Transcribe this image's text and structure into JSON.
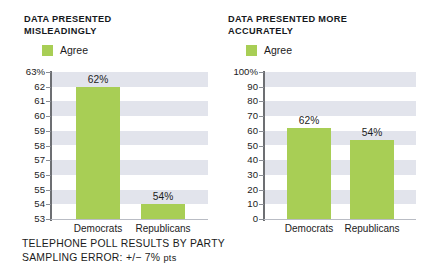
{
  "figure": {
    "background_color": "#ffffff",
    "accent_color": "#a8ce55",
    "band_color": "#e2e4ec",
    "axis_color": "#6d6f73",
    "caption_line_1": "TELEPHONE POLL RESULTS BY PARTY",
    "caption_line_2_prefix": "SAMPLING ERROR: ",
    "caption_line_2_value": "+/− 7% ",
    "caption_line_2_suffix": "pts"
  },
  "panels": [
    {
      "id": "left",
      "title": "DATA PRESENTED\nMISLEADINGLY",
      "legend_label": "Agree"
    },
    {
      "id": "right",
      "title": "DATA PRESENTED MORE\nACCURATELY",
      "legend_label": "Agree"
    }
  ],
  "chart_data": [
    {
      "type": "bar",
      "title": "DATA PRESENTED MISLEADINGLY",
      "xlabel": "",
      "ylabel": "",
      "categories": [
        "Democrats",
        "Republicans"
      ],
      "series": [
        {
          "name": "Agree",
          "values": [
            62,
            54
          ],
          "color": "#a8ce55"
        }
      ],
      "value_labels": [
        "62%",
        "54%"
      ],
      "ylim": [
        53,
        63
      ],
      "yticks": [
        53,
        54,
        55,
        56,
        57,
        58,
        59,
        60,
        61,
        62,
        63
      ],
      "ytick_labels": [
        "53",
        "54",
        "55",
        "56",
        "57",
        "58",
        "59",
        "60",
        "61",
        "62",
        "63%"
      ],
      "grid": "horizontal-alternating-bands",
      "legend": [
        "Agree"
      ],
      "legend_position": "top-left",
      "note": "Truncated y-axis starting at 53% exaggerates the difference"
    },
    {
      "type": "bar",
      "title": "DATA PRESENTED MORE ACCURATELY",
      "xlabel": "",
      "ylabel": "",
      "categories": [
        "Democrats",
        "Republicans"
      ],
      "series": [
        {
          "name": "Agree",
          "values": [
            62,
            54
          ],
          "color": "#a8ce55"
        }
      ],
      "value_labels": [
        "62%",
        "54%"
      ],
      "ylim": [
        0,
        100
      ],
      "yticks": [
        0,
        10,
        20,
        30,
        40,
        50,
        60,
        70,
        80,
        90,
        100
      ],
      "ytick_labels": [
        "0",
        "10",
        "20",
        "30",
        "40",
        "50",
        "60",
        "70",
        "80",
        "90",
        "100%"
      ],
      "grid": "horizontal-alternating-bands",
      "legend": [
        "Agree"
      ],
      "legend_position": "top-left",
      "note": "Full 0-100% y-axis shows the true proportional difference"
    }
  ]
}
